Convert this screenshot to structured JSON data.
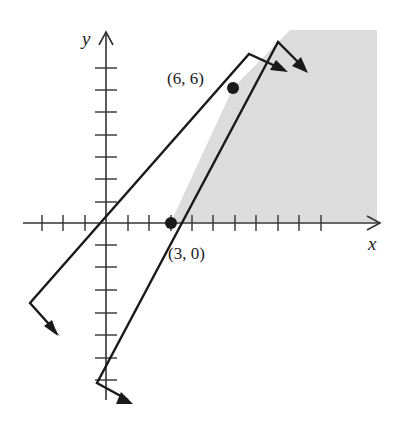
{
  "figure": {
    "axes": {
      "x_label": "x",
      "y_label": "y",
      "x_ticks": [
        -3,
        -2,
        -1,
        1,
        2,
        3,
        4,
        5,
        6,
        7,
        8,
        9,
        10
      ],
      "y_ticks": [
        -8,
        -7,
        -6,
        -5,
        -4,
        -3,
        -2,
        -1,
        1,
        2,
        3,
        4,
        5,
        6,
        7
      ]
    },
    "points": [
      {
        "label": "(6, 6)",
        "x": 6,
        "y": 6
      },
      {
        "label": "(3, 0)",
        "x": 3,
        "y": 0
      }
    ],
    "lines": [
      {
        "name": "y = x",
        "slope": 1,
        "intercept": 0
      },
      {
        "name": "y = 2x - 6",
        "slope": 2,
        "intercept": -6
      }
    ],
    "shaded_region": {
      "description": "feasible region bounded by y >= 0 and y <= 2x - 6",
      "fill": "#dcdcdc"
    },
    "colors": {
      "line": "#1a1a1a",
      "axis": "#333333",
      "shade": "#dcdcdc"
    }
  }
}
